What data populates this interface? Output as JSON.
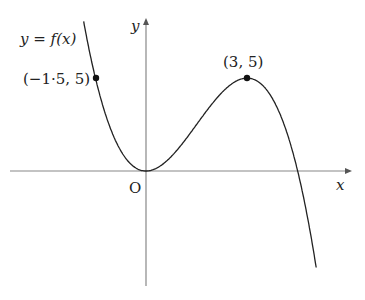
{
  "chart_data": {
    "type": "line",
    "title": "",
    "function_label": "y = f(x)",
    "xlabel": "x",
    "ylabel": "y",
    "origin_label": "O",
    "grid": false,
    "model": "f(x) = 0.37 x^2 (4.5 - x)",
    "annotated_points": [
      {
        "label": "(−1·5, 5)",
        "x": -1.5,
        "y": 5
      },
      {
        "label": "(3, 5)",
        "x": 3,
        "y": 5
      }
    ],
    "features": {
      "local_minimum": {
        "x": 0,
        "y": 0
      },
      "local_maximum": {
        "x": 3,
        "y": 5
      },
      "x_intercepts": [
        0,
        4.5
      ]
    },
    "x_range": [
      -4,
      6.5
    ],
    "y_range": [
      -6.5,
      8.5
    ]
  },
  "labels": {
    "function": "y = f(x)",
    "point_left": "(−1·5, 5)",
    "point_max": "(3, 5)",
    "origin": "O",
    "x_axis": "x",
    "y_axis": "y"
  }
}
